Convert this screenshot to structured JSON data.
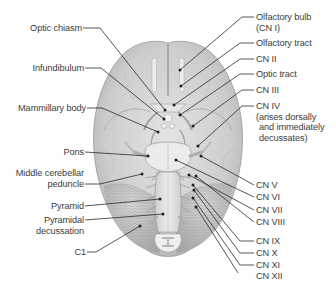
{
  "figure": {
    "colors": {
      "brain_fill": "#c9c9c9",
      "brain_light": "#e2e2e2",
      "brain_shadow": "#a8a8a8",
      "leader_line": "#2b2b2b",
      "label_text": "#3c3c3c",
      "background": "#ffffff"
    }
  },
  "labels": {
    "left": [
      {
        "id": "optic-chiasm",
        "lines": [
          "Optic chiasm"
        ]
      },
      {
        "id": "infundibulum",
        "lines": [
          "Infundibulum"
        ]
      },
      {
        "id": "mammillary-body",
        "lines": [
          "Mammillary body"
        ]
      },
      {
        "id": "pons",
        "lines": [
          "Pons"
        ]
      },
      {
        "id": "middle-cerebellar-peduncle",
        "lines": [
          "Middle cerebellar",
          "peduncle"
        ]
      },
      {
        "id": "pyramid",
        "lines": [
          "Pyramid"
        ]
      },
      {
        "id": "pyramidal-decussation",
        "lines": [
          "Pyramidal",
          "decussation"
        ]
      },
      {
        "id": "c1",
        "lines": [
          "C1"
        ]
      }
    ],
    "right": [
      {
        "id": "olfactory-bulb",
        "lines": [
          "Olfactory bulb",
          "(CN I)"
        ]
      },
      {
        "id": "olfactory-tract",
        "lines": [
          "Olfactory tract"
        ]
      },
      {
        "id": "cn-ii",
        "lines": [
          "CN II"
        ]
      },
      {
        "id": "optic-tract",
        "lines": [
          "Optic tract"
        ]
      },
      {
        "id": "cn-iii",
        "lines": [
          "CN III"
        ]
      },
      {
        "id": "cn-iv",
        "lines": [
          "CN IV",
          "(arises dorsally",
          "and immediately",
          "decussates)"
        ]
      },
      {
        "id": "cn-v",
        "lines": [
          "CN V"
        ]
      },
      {
        "id": "cn-vi",
        "lines": [
          "CN VI"
        ]
      },
      {
        "id": "cn-vii",
        "lines": [
          "CN VII"
        ]
      },
      {
        "id": "cn-viii",
        "lines": [
          "CN VIII"
        ]
      },
      {
        "id": "cn-ix",
        "lines": [
          "CN IX"
        ]
      },
      {
        "id": "cn-x",
        "lines": [
          "CN X"
        ]
      },
      {
        "id": "cn-xi",
        "lines": [
          "CN XI"
        ]
      },
      {
        "id": "cn-xii",
        "lines": [
          "CN XII"
        ]
      }
    ]
  }
}
